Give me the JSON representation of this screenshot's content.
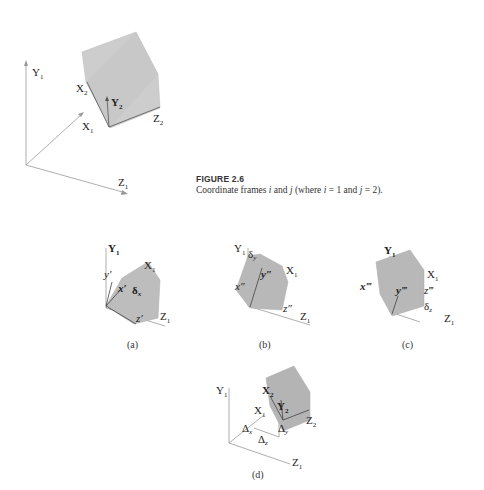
{
  "figure": {
    "number_label": "FIGURE 2.6",
    "caption_parts": [
      "Coordinate frames ",
      "i",
      " and ",
      "j",
      " (where ",
      "i",
      " = 1 and ",
      "j",
      " = 2)."
    ]
  },
  "main_diagram": {
    "frame1_axes": {
      "y": "Y",
      "x": "X",
      "z": "Z",
      "subscript": "1"
    },
    "frame2_axes": {
      "y": "Y",
      "x": "X",
      "z": "Z",
      "subscript": "2"
    }
  },
  "panels": [
    {
      "id": "a",
      "label": "(a)",
      "axes": {
        "Y": "Y",
        "X": "X",
        "Z": "Z",
        "sub": "1"
      },
      "rotated": {
        "y": "y′",
        "x": "x′",
        "z": "z′"
      },
      "delta": "δ",
      "delta_sub": "x"
    },
    {
      "id": "b",
      "label": "(b)",
      "axes": {
        "Y": "Y",
        "X": "X",
        "Z": "Z",
        "sub": "1"
      },
      "rotated": {
        "y": "y″",
        "x": "x″",
        "z": "z″"
      },
      "delta": "δ",
      "delta_sub": "y"
    },
    {
      "id": "c",
      "label": "(c)",
      "axes": {
        "Y": "Y",
        "X": "X",
        "Z": "Z",
        "sub": "1"
      },
      "rotated": {
        "y": "y‴",
        "x": "x‴",
        "z": "z‴"
      },
      "delta": "δ",
      "delta_sub": "z"
    },
    {
      "id": "d",
      "label": "(d)",
      "axes": {
        "Y": "Y",
        "X": "X",
        "Z": "Z",
        "sub": "1"
      },
      "frame2": {
        "X": "X",
        "Y": "Y",
        "Z": "Z",
        "sub": "2"
      },
      "translations": {
        "dx": "Δ",
        "dx_sub": "x",
        "dy": "Δ",
        "dy_sub": "y",
        "dz": "Δ",
        "dz_sub": "z"
      }
    }
  ],
  "colors": {
    "cube_face": "#c8c8c8",
    "cube_side": "#b4b4b4",
    "axis": "#999999",
    "text": "#222222"
  }
}
